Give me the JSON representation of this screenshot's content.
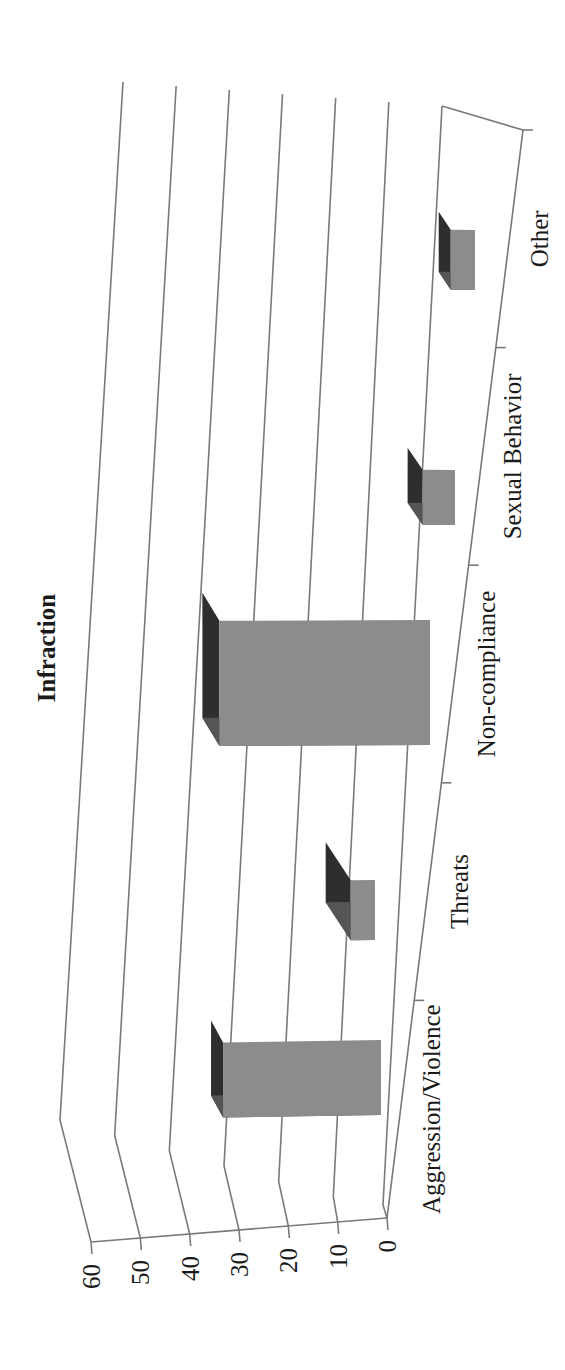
{
  "chart_data": {
    "type": "bar",
    "style": "3d-column, rotated 90deg counter-clockwise on page",
    "title": "Infraction",
    "xlabel": "",
    "ylabel": "",
    "categories": [
      "Aggression/Violence",
      "Threats",
      "Non-compliance",
      "Sexual Behavior",
      "Other"
    ],
    "values": [
      39,
      6,
      52,
      8,
      6
    ],
    "ylim": [
      0,
      60
    ],
    "yticks": [
      "0",
      "10",
      "20",
      "30",
      "40",
      "50",
      "60"
    ],
    "grid": true,
    "legend": null,
    "colors": {
      "bar_front": "#8c8c8c",
      "bar_top": "#2e2e2e",
      "bar_side": "#555555",
      "gridline": "#7a7a7a",
      "text": "#1a1a1a"
    }
  }
}
